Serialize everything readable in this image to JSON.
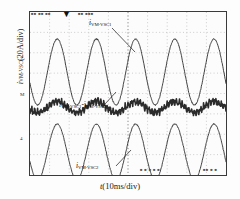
{
  "axes": {
    "ylabel_symbol": "i",
    "ylabel_sub": "VM-VSC",
    "ylabel_unit": "(20A/div)",
    "xlabel_symbol": "t",
    "xlabel_unit": "(10ms/div)"
  },
  "ticks": {
    "y": [
      "3",
      "M",
      "4"
    ]
  },
  "annotations": [
    {
      "name": "top-trace-label",
      "symbol": "i",
      "sub": "VM-VSC1",
      "op": "",
      "sub2": ""
    },
    {
      "name": "middle-trace-label",
      "symbol": "i",
      "sub": "VM-VSC1",
      "op": "-i",
      "sub2": "VM-VSC2"
    },
    {
      "name": "bottom-trace-label",
      "symbol": "i",
      "sub": "VM-VSC2",
      "op": "",
      "sub2": ""
    }
  ],
  "scope_text": {
    "top_left": "■■ ■■ ■■",
    "top_marker": "▼",
    "top_center": "■■  ■■■",
    "bottom_center": "■ ■ ■ ■ ■",
    "bottom_right": "■■ ■ ■"
  },
  "colors": {
    "trace": "#2b2b2b",
    "grid": "#b9b9b9",
    "frame": "#3a3a3a",
    "background": "#fcfcfc"
  },
  "chart_data": {
    "type": "line",
    "title": "",
    "xlabel": "t(10ms/div)",
    "ylabel": "i_VM-VSC(20A/div)",
    "xlim": [
      0,
      50
    ],
    "ylim": [
      0,
      163
    ],
    "grid": true,
    "grid_style": "dotted",
    "x_divisions": 10,
    "y_divisions": 8,
    "legend": "inline-leader-lines",
    "x_unit": "ms",
    "y_unit": "A",
    "x_per_div": 10,
    "y_per_div": 20,
    "series": [
      {
        "name": "i_VM-VSC1",
        "description": "upper sinusoidal current trace, ~5 cycles, large amplitude",
        "cycles": 5,
        "baseline_y": 60,
        "amplitude_y": 33,
        "phase_deg": 200,
        "noise": 1.1,
        "thickness": 0.9
      },
      {
        "name": "i_VM-VSC1-i_VM-VSC2",
        "description": "middle difference current, small ripple with high-frequency switching noise",
        "cycles": 5,
        "baseline_y": 95,
        "amplitude_y": 5.5,
        "phase_deg": 200,
        "noise": 3.4,
        "thickness": 1.6
      },
      {
        "name": "i_VM-VSC2",
        "description": "lower sinusoidal current trace, ~5 cycles, large amplitude",
        "cycles": 5,
        "baseline_y": 140,
        "amplitude_y": 28,
        "phase_deg": 200,
        "noise": 1.1,
        "thickness": 0.9
      }
    ]
  }
}
